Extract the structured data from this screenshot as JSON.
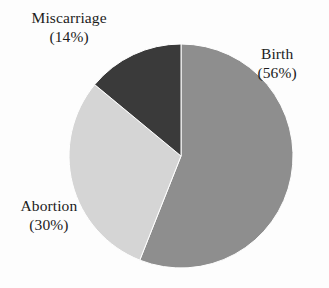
{
  "chart_data": {
    "type": "pie",
    "title": "",
    "subtitle": "",
    "xlabel": "",
    "ylabel": "",
    "grid": false,
    "legend_position": "none",
    "label_format": "name above, (percent) below",
    "start_angle_deg": 0,
    "direction": "clockwise",
    "categories": [
      "Birth",
      "Abortion",
      "Miscarriage"
    ],
    "values": [
      56,
      30,
      14
    ],
    "unit": "%",
    "slices": [
      {
        "name": "Birth",
        "percent": 56,
        "percent_label": "(56%)",
        "color": "#8e8e8e",
        "start_deg": 0,
        "end_deg": 201.6,
        "label_position": "right"
      },
      {
        "name": "Abortion",
        "percent": 30,
        "percent_label": "(30%)",
        "color": "#d5d5d5",
        "start_deg": 201.6,
        "end_deg": 309.6,
        "label_position": "left"
      },
      {
        "name": "Miscarriage",
        "percent": 14,
        "percent_label": "(14%)",
        "color": "#3a3a3a",
        "start_deg": 309.6,
        "end_deg": 360,
        "label_position": "top-left"
      }
    ]
  },
  "labels": {
    "birth": {
      "name": "Birth",
      "percent": "(56%)"
    },
    "abortion": {
      "name": "Abortion",
      "percent": "(30%)"
    },
    "miscarriage": {
      "name": "Miscarriage",
      "percent": "(14%)"
    }
  },
  "colors": {
    "background": "#fdfdfd",
    "text": "#1c1c1c",
    "slice_birth": "#8e8e8e",
    "slice_abortion": "#d5d5d5",
    "slice_miscarriage": "#3a3a3a",
    "slice_outline": "#ffffff"
  },
  "geometry": {
    "center_x": 181,
    "center_y": 156,
    "radius": 112
  }
}
